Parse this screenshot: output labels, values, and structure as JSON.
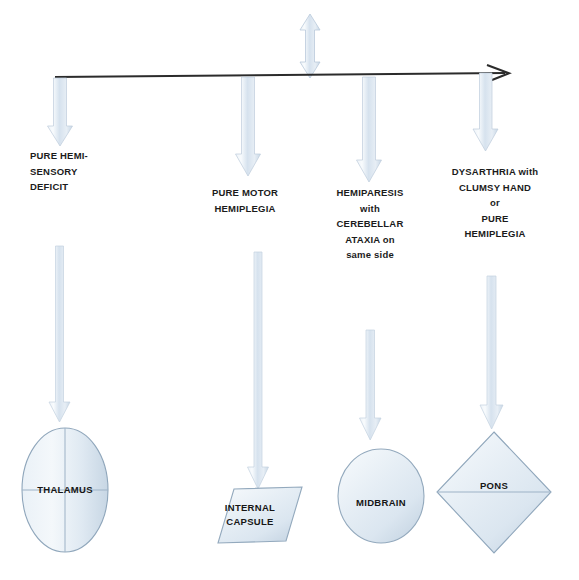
{
  "diagram": {
    "type": "flowchart",
    "background_color": "#ffffff",
    "arrow_fill_color": "#dde6ef",
    "arrow_stroke_color": "#b9c9da",
    "shape_fill_color": "#e2eaf2",
    "shape_stroke_color": "#9fb3c6",
    "axis_color": "#2b2b2b",
    "text_color": "#1b1b1b"
  },
  "top_connector": {
    "icon": "double-headed-vertical-arrow",
    "label": ""
  },
  "axis": {
    "icon": "horizontal-right-arrow",
    "label": ""
  },
  "branches": [
    {
      "id": "branch-1",
      "drop_arrow_icon": "down-arrow",
      "syndrome_lines": [
        "PURE HEMI-",
        "SENSORY",
        "DEFICIT"
      ],
      "align": "left",
      "long_arrow_icon": "long-down-arrow",
      "site_shape": "ellipse",
      "site_label_lines": [
        "THALAMUS"
      ]
    },
    {
      "id": "branch-2",
      "drop_arrow_icon": "down-arrow",
      "syndrome_lines": [
        "PURE MOTOR",
        "HEMIPLEGIA"
      ],
      "align": "center",
      "long_arrow_icon": "long-down-arrow",
      "site_shape": "parallelogram",
      "site_label_lines": [
        "INTERNAL",
        "CAPSULE"
      ]
    },
    {
      "id": "branch-3",
      "drop_arrow_icon": "down-arrow",
      "syndrome_lines": [
        "HEMIPARESIS",
        "with",
        "CEREBELLAR",
        "ATAXIA on",
        "same  side"
      ],
      "align": "center",
      "long_arrow_icon": "long-down-arrow",
      "site_shape": "circle",
      "site_label_lines": [
        "MIDBRAIN"
      ]
    },
    {
      "id": "branch-4",
      "drop_arrow_icon": "down-arrow",
      "syndrome_lines": [
        "DYSARTHRIA with",
        "CLUMSY HAND",
        "or",
        "PURE",
        "HEMIPLEGIA"
      ],
      "align": "center",
      "long_arrow_icon": "long-down-arrow",
      "site_shape": "diamond",
      "site_label_lines": [
        "PONS"
      ]
    }
  ]
}
